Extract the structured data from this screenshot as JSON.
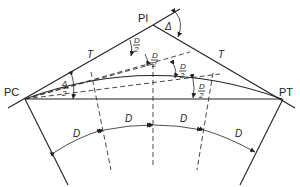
{
  "diagram": {
    "points": {
      "pc": "PC",
      "pi": "PI",
      "pt": "PT"
    },
    "tangent_labels": {
      "left": "T",
      "right": "T"
    },
    "angles": {
      "delta": "Δ",
      "delta_half_num": "Δ",
      "delta_half_den": "2",
      "d_half_num": "D",
      "d_half_den": "2"
    },
    "arc_labels": [
      "D",
      "D",
      "D",
      "D"
    ],
    "colors": {
      "line": "#222222",
      "background": "#ffffff"
    }
  }
}
